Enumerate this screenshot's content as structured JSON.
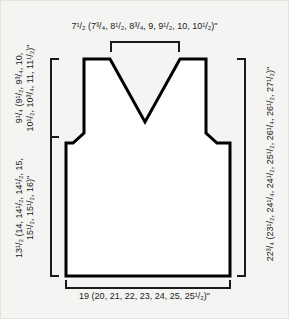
{
  "diagram": {
    "kind": "garment-schematic",
    "garment": "v-neck-vest-front",
    "background_color": "#f4f4f2",
    "outline_color": "#000000",
    "fill_color": "#ffffff",
    "bracket_color": "#1a1a1a"
  },
  "measurements": {
    "shoulder_to_shoulder_neck_width": {
      "position": "top",
      "text": "7¹/₂ (7³/₄, 8¹/₂, 8³/₄, 9, 9¹/₂, 10, 10¹/₂)\"",
      "base": "7 1/2",
      "alternates": [
        "7 3/4",
        "8 1/2",
        "8 3/4",
        "9",
        "9 1/2",
        "10",
        "10 1/2"
      ],
      "unit": "inches"
    },
    "armhole_depth": {
      "position": "left-upper",
      "text": "9¹/₄ (9¹/₂, 9³/₄, 10,\n10¹/₂, 10³/₄, 11, 11¹/₂)\"",
      "base": "9 1/4",
      "alternates": [
        "9 1/2",
        "9 3/4",
        "10",
        "10 1/2",
        "10 3/4",
        "11",
        "11 1/2"
      ],
      "unit": "inches"
    },
    "body_length_to_underarm": {
      "position": "left-lower",
      "text": "13¹/₂ (14, 14¹/₂, 14¹/₂, 15,\n15¹/₂, 15¹/₂, 16)\"",
      "base": "13 1/2",
      "alternates": [
        "14",
        "14 1/2",
        "14 1/2",
        "15",
        "15 1/2",
        "15 1/2",
        "16"
      ],
      "unit": "inches"
    },
    "total_length": {
      "position": "right",
      "text": "22³/₄ (23¹/₂, 24¹/₄, 24¹/₂, 25¹/₂, 26¹/₄, 26¹/₂, 27¹/₂)\"",
      "base": "22 3/4",
      "alternates": [
        "23 1/2",
        "24 1/4",
        "24 1/2",
        "25 1/2",
        "26 1/4",
        "26 1/2",
        "27 1/2"
      ],
      "unit": "inches"
    },
    "bottom_width": {
      "position": "bottom",
      "text": "19 (20, 21, 22, 23, 24, 25, 25¹/₂)\"",
      "base": "19",
      "alternates": [
        "20",
        "21",
        "22",
        "23",
        "24",
        "25",
        "25 1/2"
      ],
      "unit": "inches"
    }
  }
}
